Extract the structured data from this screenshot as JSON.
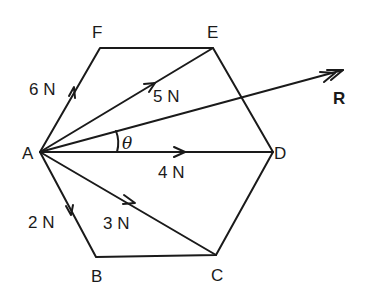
{
  "figure": {
    "type": "force diagram on regular hexagon",
    "colors": {
      "ink": "#1a1a1a",
      "background": "#ffffff"
    }
  },
  "vertices": {
    "A": {
      "label": "A",
      "x": 40,
      "y": 152
    },
    "B": {
      "label": "B",
      "x": 96,
      "y": 257
    },
    "C": {
      "label": "C",
      "x": 216,
      "y": 255
    },
    "D": {
      "label": "D",
      "x": 273,
      "y": 152
    },
    "E": {
      "label": "E",
      "x": 213,
      "y": 48
    },
    "F": {
      "label": "F",
      "x": 100,
      "y": 48
    }
  },
  "forces": [
    {
      "name": "AF",
      "label": "6 N",
      "from": "A",
      "to": "F"
    },
    {
      "name": "AE",
      "label": "5 N",
      "from": "A",
      "to": "E"
    },
    {
      "name": "AD",
      "label": "4 N",
      "from": "A",
      "to": "D"
    },
    {
      "name": "AC",
      "label": "3 N",
      "from": "A",
      "to": "C"
    },
    {
      "name": "AB",
      "label": "2 N",
      "from": "A",
      "to": "B"
    }
  ],
  "resultant": {
    "label": "R",
    "tip_x": 343,
    "tip_y": 70
  },
  "angle": {
    "label": "θ",
    "between": [
      "AD",
      "R"
    ]
  }
}
